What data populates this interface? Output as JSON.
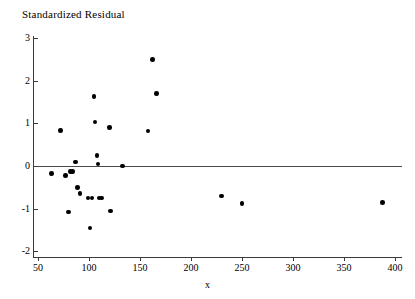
{
  "chart_data": {
    "type": "scatter",
    "title": "Standardized Residual",
    "xlabel": "x",
    "ylabel": "",
    "xlim": [
      38,
      400
    ],
    "ylim": [
      -2,
      3
    ],
    "xticks": [
      50,
      100,
      150,
      200,
      250,
      300,
      350,
      400
    ],
    "yticks": [
      3,
      2,
      1,
      0,
      -1,
      -2
    ],
    "grid": false,
    "legend": null,
    "reference_lines": [
      {
        "axis": "y",
        "value": 0,
        "label": "zero-residual-line"
      }
    ],
    "series": [
      {
        "name": "standardized residuals",
        "marker": "filled-circle",
        "color": "#000000",
        "points": [
          {
            "x": 63,
            "y": -0.18
          },
          {
            "x": 72,
            "y": 0.83
          },
          {
            "x": 77,
            "y": -0.22
          },
          {
            "x": 80,
            "y": -1.08
          },
          {
            "x": 82,
            "y": -0.13
          },
          {
            "x": 84,
            "y": -0.13
          },
          {
            "x": 87,
            "y": 0.09
          },
          {
            "x": 89,
            "y": -0.5
          },
          {
            "x": 91,
            "y": -0.65
          },
          {
            "x": 99,
            "y": -0.75
          },
          {
            "x": 101,
            "y": -1.45
          },
          {
            "x": 103,
            "y": -0.75
          },
          {
            "x": 105,
            "y": 1.63
          },
          {
            "x": 106,
            "y": 1.03
          },
          {
            "x": 108,
            "y": 0.25
          },
          {
            "x": 109,
            "y": 0.05
          },
          {
            "x": 110,
            "y": -0.75
          },
          {
            "x": 112,
            "y": -0.75
          },
          {
            "x": 120,
            "y": 0.9
          },
          {
            "x": 121,
            "y": -1.05
          },
          {
            "x": 133,
            "y": 0.0
          },
          {
            "x": 158,
            "y": 0.82
          },
          {
            "x": 162,
            "y": 2.5
          },
          {
            "x": 166,
            "y": 1.7
          },
          {
            "x": 230,
            "y": -0.7
          },
          {
            "x": 250,
            "y": -0.88
          },
          {
            "x": 388,
            "y": -0.85
          }
        ]
      }
    ]
  }
}
